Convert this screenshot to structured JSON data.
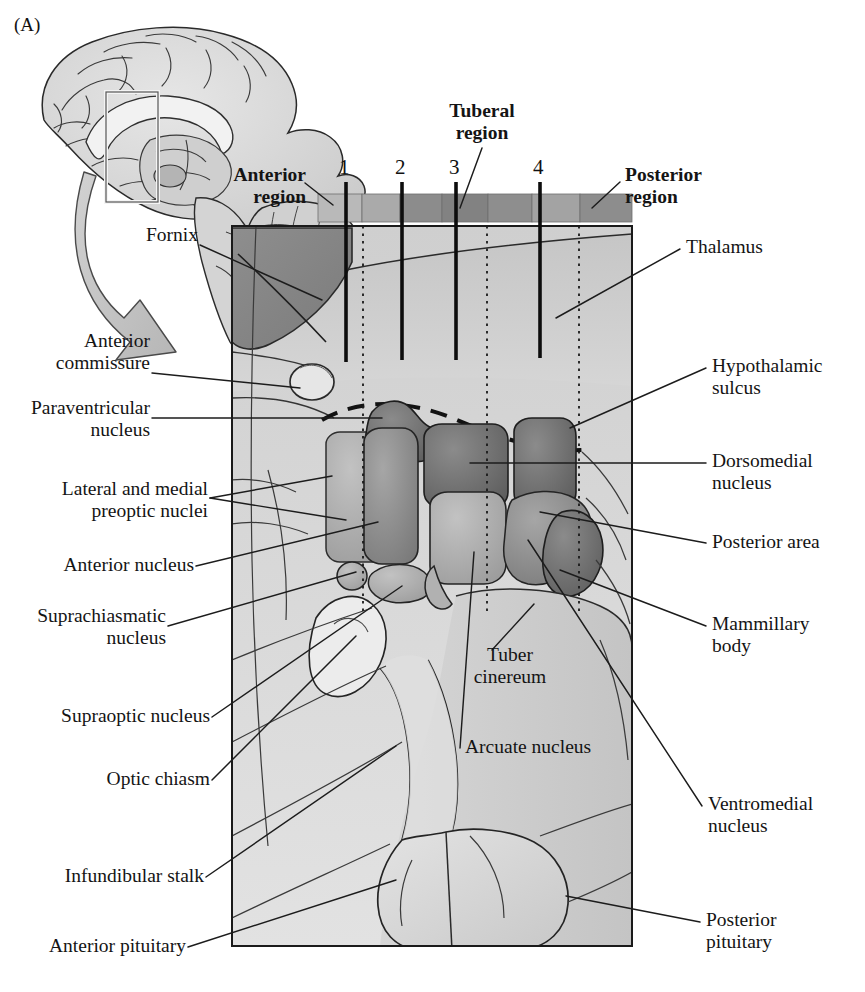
{
  "figure": {
    "panel_letter": "(A)",
    "type": "anatomical-diagram"
  },
  "inset": {
    "name": "midsagittal-brain-inset",
    "callout_box": "hypothalamus region outline"
  },
  "region_bar": {
    "segments": [
      {
        "name": "anterior",
        "shade": "#b8b8b8"
      },
      {
        "name": "anterior-2",
        "shade": "#a8a8a8"
      },
      {
        "name": "tuberal-1",
        "shade": "#8e8e8e"
      },
      {
        "name": "tuberal-2",
        "shade": "#7e7e7e"
      },
      {
        "name": "tuberal-3",
        "shade": "#8a8a8a"
      },
      {
        "name": "posterior-1",
        "shade": "#a0a0a0"
      },
      {
        "name": "posterior-2",
        "shade": "#8a8a8a"
      }
    ]
  },
  "region_labels": {
    "anterior": "Anterior\nregion",
    "tuberal": "Tuberal\nregion",
    "posterior": "Posterior\nregion"
  },
  "section_numbers": [
    "1",
    "2",
    "3",
    "4"
  ],
  "labels_left": [
    {
      "id": "fornix",
      "text": "Fornix"
    },
    {
      "id": "anterior-commissure",
      "text": "Anterior\ncommissure"
    },
    {
      "id": "paraventricular-nucleus",
      "text": "Paraventricular\nnucleus"
    },
    {
      "id": "lateral-and-medial-preoptic-nuclei",
      "text": "Lateral and medial\npreoptic nuclei"
    },
    {
      "id": "anterior-nucleus",
      "text": "Anterior nucleus"
    },
    {
      "id": "suprachiasmatic-nucleus",
      "text": "Suprachiasmatic\nnucleus"
    },
    {
      "id": "supraoptic-nucleus",
      "text": "Supraoptic nucleus"
    },
    {
      "id": "optic-chiasm",
      "text": "Optic chiasm"
    },
    {
      "id": "infundibular-stalk",
      "text": "Infundibular stalk"
    },
    {
      "id": "anterior-pituitary",
      "text": "Anterior pituitary"
    }
  ],
  "labels_right": [
    {
      "id": "thalamus",
      "text": "Thalamus"
    },
    {
      "id": "hypothalamic-sulcus",
      "text": "Hypothalamic\nsulcus"
    },
    {
      "id": "dorsomedial-nucleus",
      "text": "Dorsomedial\nnucleus"
    },
    {
      "id": "posterior-area",
      "text": "Posterior area"
    },
    {
      "id": "mammillary-body",
      "text": "Mammillary\nbody"
    },
    {
      "id": "ventromedial-nucleus",
      "text": "Ventromedial\nnucleus"
    },
    {
      "id": "posterior-pituitary",
      "text": "Posterior\npituitary"
    }
  ],
  "labels_inner": [
    {
      "id": "tuber-cinereum",
      "text": "Tuber\ncinereum"
    },
    {
      "id": "arcuate-nucleus",
      "text": "Arcuate nucleus"
    }
  ],
  "colors": {
    "ink": "#141414",
    "frame": "#1a1a1a",
    "bg": "#ffffff",
    "tissue_light": "#d9d9d9",
    "tissue_mid": "#bdbdbd",
    "tissue_dark": "#9a9a9a",
    "nucleus_dark": "#6f6f6f",
    "nucleus_mid": "#8c8c8c",
    "nucleus_light": "#adadad"
  }
}
